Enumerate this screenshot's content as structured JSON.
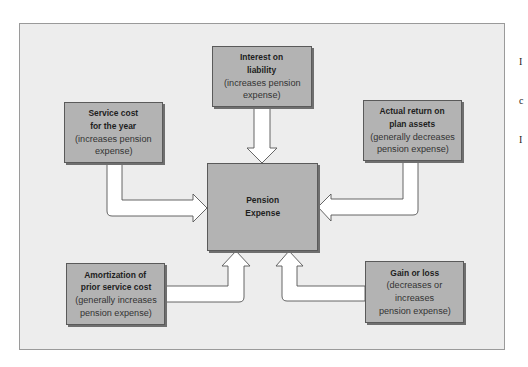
{
  "diagram": {
    "center": {
      "title_line1": "Pension",
      "title_line2": "Expense"
    },
    "components": {
      "interest": {
        "title_line1": "Interest on",
        "title_line2": "liability",
        "desc_line1": "(increases pension",
        "desc_line2": "expense)",
        "arrow_direction": "down"
      },
      "service_cost": {
        "title_line1": "Service cost",
        "title_line2": "for the year",
        "desc_line1": "(increases pension",
        "desc_line2": "expense)",
        "arrow_direction": "right"
      },
      "actual_return": {
        "title_line1": "Actual return on",
        "title_line2": "plan assets",
        "desc_line1": "(generally decreases",
        "desc_line2": "pension expense)",
        "arrow_direction": "left"
      },
      "amortization": {
        "title_line1": "Amortization of",
        "title_line2": "prior service cost",
        "desc_line1": "(generally increases",
        "desc_line2": "pension expense)",
        "arrow_direction": "up"
      },
      "gain_loss": {
        "title_line1": "Gain or loss",
        "desc_line1": "(decreases or",
        "desc_line2": "increases",
        "desc_line3": "pension expense)",
        "arrow_direction": "up"
      }
    },
    "edge_text": {
      "line1": "I",
      "line2": "c",
      "line3": "I"
    },
    "colors": {
      "frame_bg": "#ededed",
      "box_fill": "#b3b3b3",
      "box_border": "#5a5a5a",
      "arrow_fill": "#ffffff",
      "arrow_stroke": "#555555"
    }
  }
}
